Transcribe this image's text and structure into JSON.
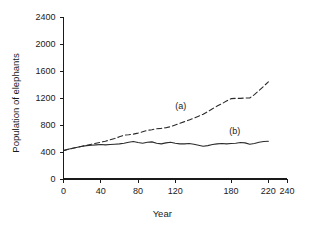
{
  "figure": {
    "background_color": "#ffffff",
    "line_color": "#2b2b2b"
  },
  "chart_data": {
    "type": "line",
    "title": "",
    "subtitle": "",
    "xlabel": "Year",
    "ylabel": "Population of elephants",
    "xlim": [
      0,
      240
    ],
    "ylim": [
      0,
      2400
    ],
    "xticks": [
      0,
      40,
      80,
      120,
      180,
      220,
      240
    ],
    "xtick_labels": [
      "0",
      "40",
      "80",
      "120",
      "180",
      "220",
      "240"
    ],
    "yticks": [
      0,
      400,
      800,
      1200,
      1600,
      2000,
      2400
    ],
    "ytick_labels": [
      "0",
      "400",
      "800",
      "1200",
      "1600",
      "2000",
      "2400"
    ],
    "grid": false,
    "legend": "inline-annotations",
    "annotations": [
      {
        "text": "(a)",
        "x": 126,
        "y": 1030
      },
      {
        "text": "(b)",
        "x": 184,
        "y": 660
      }
    ],
    "series": [
      {
        "name": "(a)",
        "style": "dashed",
        "dash_pattern": "5,3",
        "label": "(a)",
        "x": [
          0,
          5,
          10,
          15,
          20,
          25,
          30,
          35,
          40,
          45,
          50,
          55,
          60,
          65,
          70,
          75,
          80,
          85,
          90,
          95,
          100,
          105,
          110,
          115,
          120,
          125,
          130,
          135,
          140,
          145,
          150,
          155,
          160,
          165,
          170,
          175,
          180,
          185,
          190,
          195,
          200,
          205,
          210,
          215,
          220
        ],
        "values": [
          420,
          440,
          455,
          470,
          485,
          500,
          515,
          530,
          545,
          560,
          580,
          600,
          625,
          650,
          655,
          665,
          680,
          700,
          720,
          730,
          745,
          750,
          760,
          775,
          800,
          825,
          850,
          875,
          900,
          930,
          960,
          1000,
          1040,
          1080,
          1115,
          1155,
          1190,
          1195,
          1195,
          1200,
          1200,
          1250,
          1310,
          1375,
          1440
        ]
      },
      {
        "name": "(b)",
        "style": "solid",
        "dash_pattern": "",
        "label": "(b)",
        "x": [
          0,
          5,
          10,
          15,
          20,
          25,
          30,
          35,
          40,
          45,
          50,
          55,
          60,
          65,
          70,
          75,
          80,
          85,
          90,
          95,
          100,
          105,
          110,
          115,
          120,
          125,
          130,
          135,
          140,
          145,
          150,
          155,
          160,
          165,
          170,
          175,
          180,
          185,
          190,
          195,
          200,
          205,
          210,
          215,
          220
        ],
        "values": [
          420,
          440,
          455,
          470,
          485,
          495,
          500,
          505,
          510,
          505,
          510,
          515,
          520,
          530,
          545,
          555,
          540,
          530,
          545,
          550,
          530,
          520,
          535,
          545,
          530,
          520,
          520,
          525,
          515,
          500,
          485,
          495,
          510,
          520,
          525,
          520,
          525,
          530,
          540,
          535,
          515,
          525,
          545,
          555,
          560
        ]
      }
    ]
  }
}
